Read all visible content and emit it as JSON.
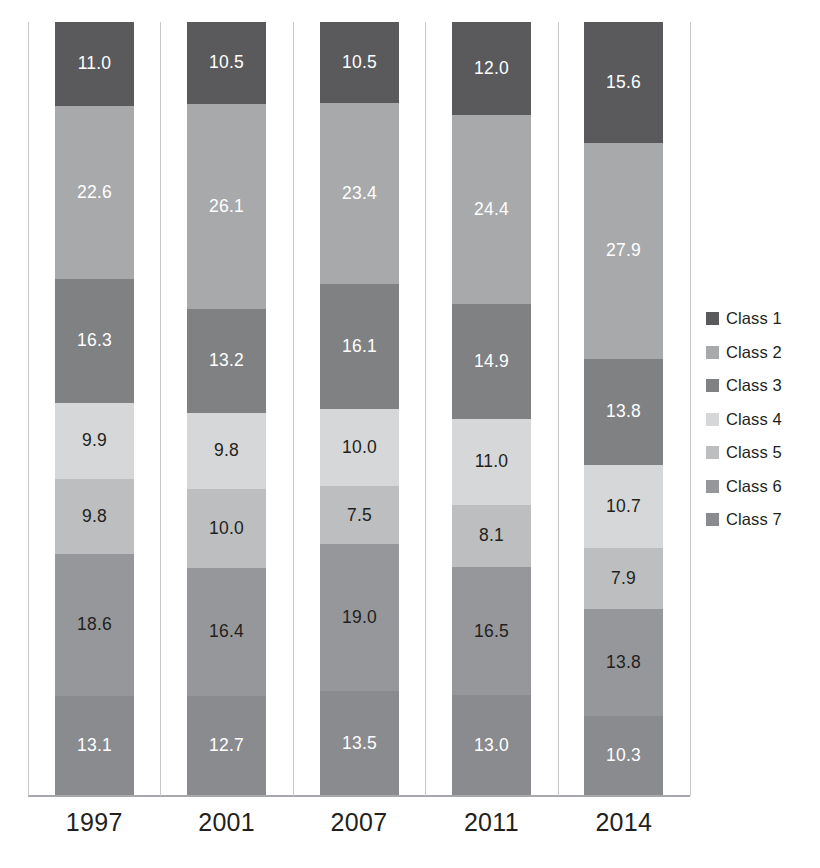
{
  "chart_data": {
    "type": "bar",
    "subtype": "stacked-100-percent",
    "title": "",
    "xlabel": "",
    "ylabel": "",
    "ylim": [
      0,
      100
    ],
    "grid": false,
    "legend_position": "right",
    "orientation": "vertical",
    "stack_order": "top-to-bottom",
    "categories": [
      "1997",
      "2001",
      "2007",
      "2011",
      "2014"
    ],
    "series": [
      {
        "name": "Class 1",
        "color": "#5a5a5c",
        "label_color": "#ffffff",
        "values": [
          11.0,
          10.5,
          10.5,
          12.0,
          15.6
        ]
      },
      {
        "name": "Class 2",
        "color": "#a8a9ab",
        "label_color": "#ffffff",
        "values": [
          22.6,
          26.1,
          23.4,
          24.4,
          27.9
        ]
      },
      {
        "name": "Class 3",
        "color": "#808183",
        "label_color": "#ffffff",
        "values": [
          16.3,
          13.2,
          16.1,
          14.9,
          13.8
        ]
      },
      {
        "name": "Class 4",
        "color": "#d6d7d9",
        "label_color": "#231f20",
        "values": [
          9.9,
          9.8,
          10.0,
          11.0,
          10.7
        ]
      },
      {
        "name": "Class 5",
        "color": "#bdbec0",
        "label_color": "#231f20",
        "values": [
          9.8,
          10.0,
          7.5,
          8.1,
          7.9
        ]
      },
      {
        "name": "Class 6",
        "color": "#96979a",
        "label_color": "#231f20",
        "values": [
          18.6,
          16.4,
          19.0,
          16.5,
          13.8
        ]
      },
      {
        "name": "Class 7",
        "color": "#8a8b8e",
        "label_color": "#ffffff",
        "values": [
          13.1,
          12.7,
          13.5,
          13.0,
          10.3
        ]
      }
    ],
    "data_labels": [
      [
        "11.0",
        "22.6",
        "16.3",
        "9.9",
        "9.8",
        "18.6",
        "13.1"
      ],
      [
        "10.5",
        "26.1",
        "13.2",
        "9.8",
        "10.0",
        "16.4",
        "12.7"
      ],
      [
        "10.5",
        "23.4",
        "16.1",
        "10.0",
        "7.5",
        "19.0",
        "13.5"
      ],
      [
        "12.0",
        "24.4",
        "14.9",
        "11.0",
        "8.1",
        "16.5",
        "13.0"
      ],
      [
        "15.6",
        "27.9",
        "13.8",
        "10.7",
        "7.9",
        "13.8",
        "10.3"
      ]
    ]
  },
  "legend": {
    "items": [
      {
        "label": "Class 1",
        "color": "#5a5a5c"
      },
      {
        "label": "Class 2",
        "color": "#a8a9ab"
      },
      {
        "label": "Class 3",
        "color": "#808183"
      },
      {
        "label": "Class 4",
        "color": "#d6d7d9"
      },
      {
        "label": "Class 5",
        "color": "#bdbec0"
      },
      {
        "label": "Class 6",
        "color": "#96979a"
      },
      {
        "label": "Class 7",
        "color": "#8a8b8e"
      }
    ]
  },
  "axis": {
    "x_tick_labels": [
      "1997",
      "2001",
      "2007",
      "2011",
      "2014"
    ]
  },
  "colors": {
    "baseline": "#a6a8ab",
    "gridline": "#c7c9cb",
    "text": "#231f20",
    "background": "#ffffff"
  }
}
